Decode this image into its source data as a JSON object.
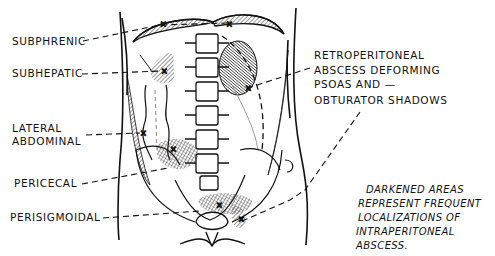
{
  "figure": {
    "type": "anatomical-diagram",
    "labels_left": [
      {
        "id": "subphrenic",
        "text": "SUBPHRENIC"
      },
      {
        "id": "subhepatic",
        "text": "SUBHEPATIC"
      },
      {
        "id": "lateral-abdominal-1",
        "text": "LATERAL"
      },
      {
        "id": "lateral-abdominal-2",
        "text": "ABDOMINAL"
      },
      {
        "id": "pericecal",
        "text": "PERICECAL"
      },
      {
        "id": "perisigmoidal",
        "text": "PERISIGMOIDAL"
      }
    ],
    "labels_right": [
      {
        "id": "retro-1",
        "text": "RETROPERITONEAL"
      },
      {
        "id": "retro-2",
        "text": "ABSCESS DEFORMING"
      },
      {
        "id": "retro-3",
        "text": "PSOAS AND —"
      },
      {
        "id": "retro-4",
        "text": "OBTURATOR SHADOWS"
      }
    ],
    "note_lines": [
      "DARKENED AREAS",
      "REPRESENT FREQUENT",
      "LOCALIZATIONS OF",
      "INTRAPERITONEAL",
      "ABSCESS."
    ],
    "colors": {
      "ink": "#111111",
      "hatch": "#555555",
      "background": "#ffffff"
    }
  }
}
